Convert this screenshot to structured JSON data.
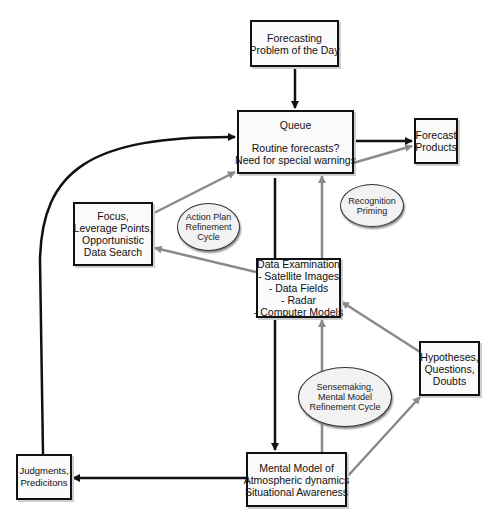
{
  "diagram": {
    "colors": {
      "primary_arrow": "#111111",
      "secondary_arrow": "#8a8a8a",
      "box_border": "#111111",
      "ellipse_fill": "#f2f2f2"
    },
    "nodes": {
      "forecasting_problem": {
        "lines": [
          "Forecasting",
          "Problem of the Day"
        ]
      },
      "queue": {
        "title": "Queue",
        "lines": [
          "Routine forecasts?",
          "Need for special warnings"
        ]
      },
      "forecast_products": {
        "lines": [
          "Forecast",
          "Products"
        ]
      },
      "focus": {
        "lines": [
          "Focus,",
          "Leverage Points,",
          "Opportunistic",
          "Data Search"
        ]
      },
      "data_examination": {
        "title": "Data Examination",
        "lines": [
          "- Satellite Images",
          "- Data Fields",
          "- Radar",
          "- Computer Models"
        ]
      },
      "hypotheses": {
        "lines": [
          "Hypotheses,",
          "Questions,",
          "Doubts"
        ]
      },
      "mental_model": {
        "lines": [
          "Mental Model of",
          "Atmospheric dynamics",
          "Situational Awareness"
        ]
      },
      "judgments": {
        "lines": [
          "Judgments,",
          "Predicitons"
        ]
      }
    },
    "cycles": {
      "action_plan": {
        "lines": [
          "Action Plan",
          "Refinement",
          "Cycle"
        ]
      },
      "recognition_priming": {
        "lines": [
          "Recognition",
          "Priming"
        ]
      },
      "sensemaking": {
        "lines": [
          "Sensemaking,",
          "Mental Model",
          "Refinement Cycle"
        ]
      }
    },
    "edges": [
      {
        "from": "Forecasting Problem of the Day",
        "to": "Queue",
        "style": "black"
      },
      {
        "from": "Queue",
        "to": "Forecast Products",
        "style": "black"
      },
      {
        "from": "Data Examination",
        "to": "Forecast Products",
        "style": "gray"
      },
      {
        "from": "Queue",
        "to": "Mental Model",
        "style": "black"
      },
      {
        "from": "Data Examination",
        "to": "Queue",
        "style": "gray"
      },
      {
        "from": "Focus",
        "to": "Queue",
        "style": "gray"
      },
      {
        "from": "Data Examination",
        "to": "Focus",
        "style": "gray"
      },
      {
        "from": "Hypotheses",
        "to": "Data Examination",
        "style": "gray"
      },
      {
        "from": "Mental Model",
        "to": "Data Examination",
        "style": "gray"
      },
      {
        "from": "Mental Model",
        "to": "Hypotheses",
        "style": "gray"
      },
      {
        "from": "Mental Model",
        "to": "Judgments",
        "style": "black"
      },
      {
        "from": "Judgments",
        "to": "Queue",
        "style": "black"
      }
    ]
  }
}
